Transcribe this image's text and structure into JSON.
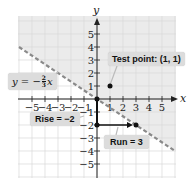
{
  "chart_data": {
    "type": "line",
    "title": "",
    "xlabel": "x",
    "ylabel": "y",
    "xlim": [
      -6,
      6
    ],
    "ylim": [
      -6,
      6
    ],
    "grid": true,
    "x_ticks": [
      -5,
      -4,
      -3,
      -2,
      -1,
      1,
      2,
      3,
      4,
      5
    ],
    "y_ticks": [
      5,
      4,
      3,
      2,
      1,
      -1,
      -2,
      -3,
      -4,
      -5
    ],
    "series": [
      {
        "name": "y = -2/3 x",
        "style": "dashed",
        "color": "#8a8a8a",
        "x": [
          -6,
          6
        ],
        "y": [
          4,
          -4
        ]
      }
    ],
    "shaded_region": {
      "description": "half-plane above the line y > -2/3 x",
      "color": "#ebebeb"
    },
    "points": [
      {
        "label": "Test point",
        "x": 1,
        "y": 1
      },
      {
        "label": "origin",
        "x": 0,
        "y": 0
      },
      {
        "label": "",
        "x": 0,
        "y": -2
      },
      {
        "label": "",
        "x": 3,
        "y": -2
      }
    ],
    "annotations": [
      {
        "text": "Test point: (1, 1)"
      },
      {
        "text": "y = -2/3 x"
      },
      {
        "text": "Rise = -2"
      },
      {
        "text": "Run = 3"
      }
    ]
  },
  "labels": {
    "x_axis": "x",
    "y_axis": "y",
    "test_point": "Test point: (1, 1)",
    "equation_lhs": "y = −",
    "equation_num": "2",
    "equation_den": "3",
    "equation_var": "x",
    "rise": "Rise = −2",
    "run": "Run = 3"
  },
  "ticks": {
    "x": [
      "−5",
      "−4",
      "−3",
      "−2",
      "−1",
      "1",
      "2",
      "3",
      "4",
      "5"
    ],
    "y": [
      "5",
      "4",
      "3",
      "2",
      "1",
      "−1",
      "−2",
      "−3",
      "−4",
      "−5"
    ]
  },
  "colors": {
    "shade": "#ebebeb",
    "grid": "#d9d9d9",
    "line": "#8a8a8a",
    "label_bg": "#dcdcdc"
  }
}
